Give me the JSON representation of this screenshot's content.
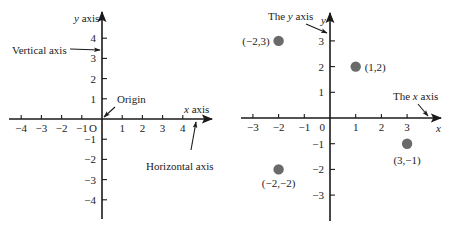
{
  "figure_left": {
    "title": "Coordinate axes",
    "origin_px": [
      102,
      119
    ],
    "unit_px": 20.2,
    "x_range": [
      -4,
      4
    ],
    "y_range": [
      -4,
      4
    ],
    "x_axis_extent_px": [
      9,
      212
    ],
    "y_axis_extent_px": [
      12,
      219
    ],
    "x_ticks": [
      -4,
      -3,
      -2,
      -1,
      1,
      2,
      3,
      4
    ],
    "y_ticks": [
      4,
      3,
      2,
      1,
      -1,
      -2,
      -3,
      -4
    ],
    "origin_label": "O",
    "y_axis_label_var": "y",
    "y_axis_label_word": " axis",
    "x_axis_label_var": "x",
    "x_axis_label_word": " axis",
    "annotations": {
      "vertical_axis": "Vertical axis",
      "horizontal_axis": "Horizontal axis",
      "origin": "Origin"
    }
  },
  "figure_right": {
    "title": "Plotted points",
    "origin_px": [
      330,
      118
    ],
    "unit_px": 25.7,
    "x_range": [
      -3,
      3
    ],
    "y_range": [
      -3,
      3
    ],
    "x_axis_extent_px": [
      241,
      441
    ],
    "y_axis_extent_px": [
      13,
      221
    ],
    "x_ticks": [
      -3,
      -2,
      -1,
      1,
      2,
      3
    ],
    "y_ticks": [
      3,
      2,
      1,
      -1,
      -2,
      -3
    ],
    "origin_label": "0",
    "x_axis_var": "x",
    "y_axis_var": "y",
    "annotations": {
      "y_axis_prefix": "The ",
      "y_axis_var": "y",
      "y_axis_suffix": " axis",
      "x_axis_prefix": "The ",
      "x_axis_var": "x",
      "x_axis_suffix": " axis"
    },
    "point_color": "#6a6a6a",
    "points": [
      {
        "x": -2,
        "y": 3,
        "label": "(−2,3)"
      },
      {
        "x": 1,
        "y": 2,
        "label": "(1,2)"
      },
      {
        "x": 3,
        "y": -1,
        "label": "(3,−1)"
      },
      {
        "x": -2,
        "y": -2,
        "label": "(−2,−2)"
      }
    ]
  },
  "chart_data": [
    {
      "type": "diagram",
      "title": "Rectangular coordinate system",
      "xlabel": "x axis",
      "ylabel": "y axis",
      "xlim": [
        -4,
        4
      ],
      "ylim": [
        -4,
        4
      ],
      "x_ticks": [
        -4,
        -3,
        -2,
        -1,
        0,
        1,
        2,
        3,
        4
      ],
      "y_ticks": [
        -4,
        -3,
        -2,
        -1,
        1,
        2,
        3,
        4
      ],
      "annotations": [
        "Vertical axis",
        "Horizontal axis",
        "Origin",
        "O"
      ],
      "grid": false
    },
    {
      "type": "scatter",
      "title": "Points in the plane",
      "xlabel": "x",
      "ylabel": "y",
      "xlim": [
        -3,
        3
      ],
      "ylim": [
        -3,
        3
      ],
      "x_ticks": [
        -3,
        -2,
        -1,
        0,
        1,
        2,
        3
      ],
      "y_ticks": [
        -3,
        -2,
        -1,
        1,
        2,
        3
      ],
      "x": [
        -2,
        1,
        3,
        -2
      ],
      "y": [
        3,
        2,
        -1,
        -2
      ],
      "point_labels": [
        "(−2,3)",
        "(1,2)",
        "(3,−1)",
        "(−2,−2)"
      ],
      "annotations": [
        "The y axis",
        "The x axis"
      ],
      "grid": false
    }
  ]
}
